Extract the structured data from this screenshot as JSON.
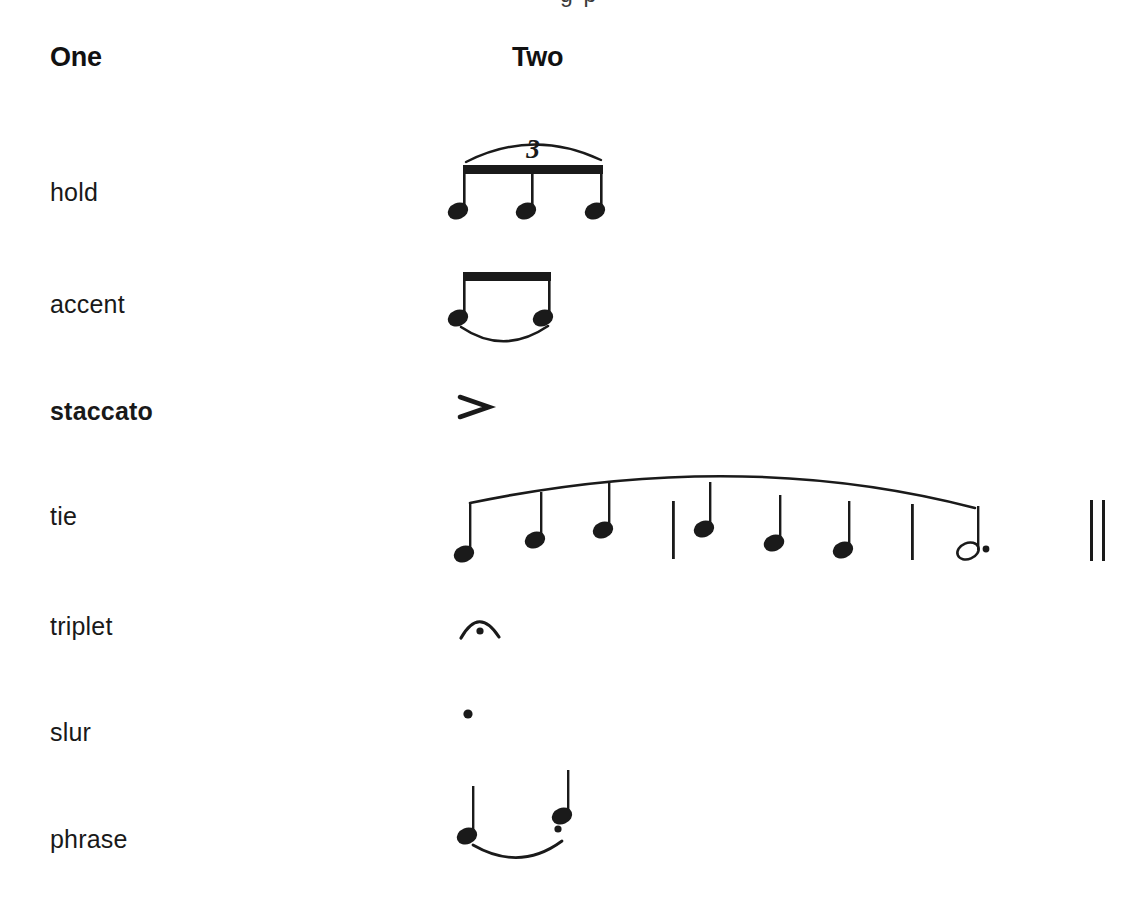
{
  "page": {
    "background_color": "#ffffff",
    "ink_color": "#1a1a1a",
    "top_cut_text": "g p"
  },
  "headers": {
    "column_one": "One",
    "column_two": "Two"
  },
  "rows": [
    {
      "label": "hold",
      "bold": false,
      "label_y": 178,
      "figure": "triplet-beamed-eighths"
    },
    {
      "label": "accent",
      "bold": false,
      "label_y": 290,
      "figure": "two-beamed-eighths-with-slur"
    },
    {
      "label": "staccato",
      "bold": true,
      "label_y": 397,
      "figure": "accent-mark"
    },
    {
      "label": "tie",
      "bold": false,
      "label_y": 502,
      "figure": "phrase-line-with-notes"
    },
    {
      "label": "triplet",
      "bold": false,
      "label_y": 612,
      "figure": "fermata-mark"
    },
    {
      "label": "slur",
      "bold": false,
      "label_y": 718,
      "figure": "staccato-dot"
    },
    {
      "label": "phrase",
      "bold": false,
      "label_y": 825,
      "figure": "two-quarter-notes-slurred-staccato"
    }
  ],
  "figures": {
    "triplet": {
      "name": "triplet-beamed-eighths",
      "tuplet_number": "3",
      "note_count": 3,
      "note_value": "eighth",
      "beam": true,
      "bracket": "arc"
    },
    "accent_row": {
      "name": "two-beamed-eighths-with-slur",
      "note_count": 2,
      "note_value": "eighth",
      "beam": true,
      "slur": "below"
    },
    "accent_mark": {
      "name": "accent-mark",
      "glyph": ">"
    },
    "tie_row": {
      "name": "phrase-line-with-notes",
      "note_value": "quarter",
      "note_count": 7,
      "final_note": "dotted-half",
      "barlines": 2,
      "ending": "double-barline",
      "phrase_mark": "above"
    },
    "fermata": {
      "name": "fermata-mark",
      "glyph": "arc-with-dot"
    },
    "staccato": {
      "name": "staccato-dot",
      "glyph": "dot"
    },
    "phrase_row": {
      "name": "two-quarter-notes-slurred-staccato",
      "note_count": 2,
      "note_value": "quarter",
      "slur": "below",
      "staccato_on_second": true
    }
  }
}
